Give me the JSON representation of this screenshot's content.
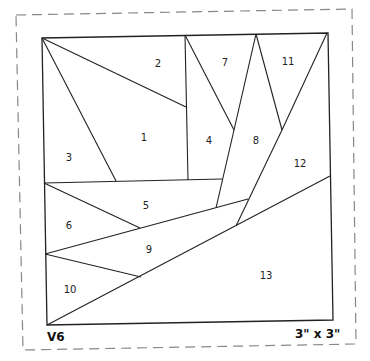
{
  "pattern": {
    "version_label": "V6",
    "size_label": "3\" x 3\"",
    "colors": {
      "line": "#222222",
      "dashed_border": "#888888",
      "background": "#ffffff"
    },
    "pieces": [
      {
        "id": "1",
        "label": "1",
        "x": 144,
        "y": 137
      },
      {
        "id": "2",
        "label": "2",
        "x": 158,
        "y": 63
      },
      {
        "id": "3",
        "label": "3",
        "x": 69,
        "y": 157
      },
      {
        "id": "4",
        "label": "4",
        "x": 209,
        "y": 140
      },
      {
        "id": "5",
        "label": "5",
        "x": 146,
        "y": 205
      },
      {
        "id": "6",
        "label": "6",
        "x": 69,
        "y": 225
      },
      {
        "id": "7",
        "label": "7",
        "x": 225,
        "y": 62
      },
      {
        "id": "8",
        "label": "8",
        "x": 256,
        "y": 140
      },
      {
        "id": "9",
        "label": "9",
        "x": 149,
        "y": 249
      },
      {
        "id": "10",
        "label": "10",
        "x": 70,
        "y": 289
      },
      {
        "id": "11",
        "label": "11",
        "x": 288,
        "y": 61
      },
      {
        "id": "12",
        "label": "12",
        "x": 300,
        "y": 163
      },
      {
        "id": "13",
        "label": "13",
        "x": 266,
        "y": 275
      }
    ]
  }
}
